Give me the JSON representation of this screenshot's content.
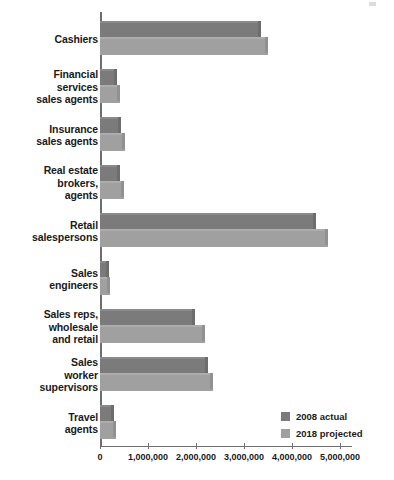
{
  "chart_data": {
    "type": "bar",
    "orientation": "horizontal",
    "title": "",
    "xlabel": "",
    "ylabel": "",
    "xlim": [
      0,
      5250000
    ],
    "grid": false,
    "legend_position": "bottom-right",
    "categories": [
      "Cashiers",
      "Financial\nservices\nsales agents",
      "Insurance\nsales agents",
      "Real estate\nbrokers,\nagents",
      "Retail\nsalespersons",
      "Sales\nengineers",
      "Sales reps,\nwholesale\nand retail",
      "Sales\nworker\nsupervisors",
      "Travel\nagents"
    ],
    "series": [
      {
        "name": "2008 actual",
        "color": "#7b7b7b",
        "values": [
          3360000,
          350000,
          440000,
          420000,
          4490000,
          190000,
          1970000,
          2250000,
          300000
        ]
      },
      {
        "name": "2018 projected",
        "color": "#a0a0a0",
        "values": [
          3490000,
          420000,
          520000,
          510000,
          4760000,
          210000,
          2180000,
          2350000,
          330000
        ]
      }
    ],
    "xticks": [
      0,
      1000000,
      2000000,
      3000000,
      4000000,
      5000000
    ],
    "xtick_labels": [
      "0",
      "1,000,000",
      "2,000,000",
      "3,000,000",
      "4,000,000",
      "5,000,000"
    ]
  },
  "legend": {
    "items": [
      {
        "label": "2008 actual",
        "color": "#7b7b7b"
      },
      {
        "label": "2018 projected",
        "color": "#a0a0a0"
      }
    ]
  }
}
